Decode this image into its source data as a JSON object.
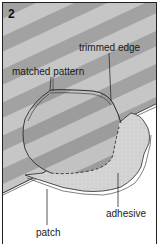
{
  "figure": {
    "step_number": "2",
    "labels": {
      "trimmed_edge": "trimmed edge",
      "matched_pattern": "matched pattern",
      "patch": "patch",
      "adhesive": "adhesive"
    },
    "colors": {
      "stripe_light": "#c9c9c9",
      "stripe_dark": "#9e9e9e",
      "patch_fill": "#d3d3d3",
      "outline": "#2a2a2a",
      "background": "#ffffff"
    }
  }
}
